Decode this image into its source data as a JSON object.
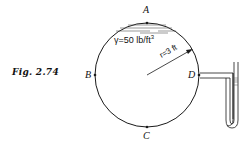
{
  "figure": {
    "label": "Fig. 2.74"
  },
  "points": {
    "A": "A",
    "B": "B",
    "C": "C",
    "D": "D"
  },
  "annotations": {
    "specific_weight_prefix": "γ=50 lb/ft",
    "specific_weight_exp": "3",
    "radius": "r=3 ft"
  },
  "colors": {
    "stroke": "#1a1a1a",
    "background": "#ffffff"
  }
}
